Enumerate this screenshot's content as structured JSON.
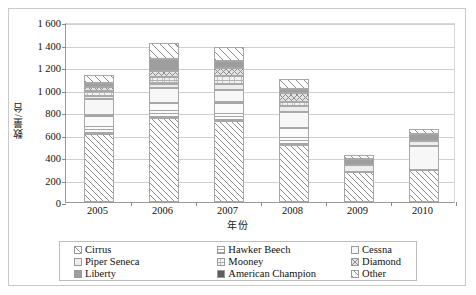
{
  "axes": {
    "y_title": "数量/台",
    "x_title": "年份",
    "y_ticks": [
      "1 600",
      "1 400",
      "1 200",
      "1 000",
      "800",
      "600",
      "400",
      "200",
      "0"
    ],
    "x_labels": [
      "2005",
      "2006",
      "2007",
      "2008",
      "2009",
      "2010"
    ]
  },
  "legend": {
    "items": [
      {
        "label": "Cirrus",
        "pattern": "diagonal-hatch",
        "color": "#ffffff"
      },
      {
        "label": "Hawker Beech",
        "pattern": "horizontal-dot",
        "color": "#fbfbfb"
      },
      {
        "label": "Cessna",
        "pattern": "solid-light",
        "color": "#f7f7f7"
      },
      {
        "label": "Piper Seneca",
        "pattern": "solid-pale",
        "color": "#ededed"
      },
      {
        "label": "Mooney",
        "pattern": "fine-dot",
        "color": "#f2f2f2"
      },
      {
        "label": "Diamond",
        "pattern": "crosshatch",
        "color": "#e4e4e4"
      },
      {
        "label": "Liberty",
        "pattern": "solid-gray",
        "color": "#9e9e9e"
      },
      {
        "label": "American Champion",
        "pattern": "solid-darkgray",
        "color": "#5d5d5d"
      },
      {
        "label": "Other",
        "pattern": "diagonal-hatch-wide",
        "color": "#fcfcfc"
      }
    ]
  },
  "chart_data": {
    "type": "bar",
    "stacked": true,
    "title": "",
    "xlabel": "年份",
    "ylabel": "数量/台",
    "ylim": [
      0,
      1600
    ],
    "ytick_step": 200,
    "grid": true,
    "legend_position": "bottom",
    "categories": [
      "2005",
      "2006",
      "2007",
      "2008",
      "2009",
      "2010"
    ],
    "series": [
      {
        "name": "Cirrus",
        "values": [
          605,
          750,
          720,
          510,
          265,
          285
        ]
      },
      {
        "name": "Hawker Beech",
        "values": [
          170,
          130,
          170,
          145,
          0,
          0
        ]
      },
      {
        "name": "Cessna",
        "values": [
          145,
          130,
          105,
          145,
          0,
          210
        ]
      },
      {
        "name": "Piper Seneca",
        "values": [
          20,
          40,
          50,
          50,
          60,
          50
        ]
      },
      {
        "name": "Mooney",
        "values": [
          50,
          60,
          75,
          40,
          0,
          0
        ]
      },
      {
        "name": "Diamond",
        "values": [
          30,
          55,
          75,
          80,
          0,
          0
        ]
      },
      {
        "name": "Liberty",
        "values": [
          40,
          110,
          55,
          35,
          55,
          60
        ]
      },
      {
        "name": "American Champion",
        "values": [
          0,
          0,
          0,
          0,
          0,
          0
        ]
      },
      {
        "name": "Other",
        "values": [
          70,
          140,
          130,
          90,
          35,
          45
        ]
      }
    ],
    "totals": [
      1130,
      1415,
      1380,
      1095,
      415,
      650
    ]
  }
}
